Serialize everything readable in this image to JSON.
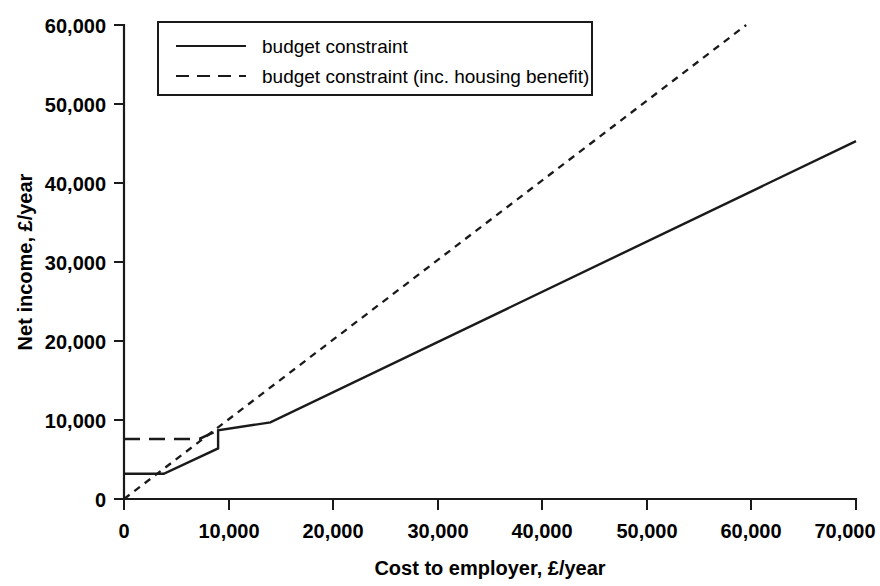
{
  "chart_data": {
    "type": "line",
    "title": "",
    "xlabel": "Cost to employer, £/year",
    "ylabel": "Net income, £/year",
    "xlim": [
      0,
      70000
    ],
    "ylim": [
      0,
      60000
    ],
    "xticks": [
      0,
      10000,
      20000,
      30000,
      40000,
      50000,
      60000,
      70000
    ],
    "yticks": [
      0,
      10000,
      20000,
      30000,
      40000,
      50000,
      60000
    ],
    "xticklabels": [
      "0",
      "10,000",
      "20,000",
      "30,000",
      "40,000",
      "50,000",
      "60,000",
      "70,000"
    ],
    "yticklabels": [
      "0",
      "10,000",
      "20,000",
      "30,000",
      "40,000",
      "50,000",
      "60,000"
    ],
    "grid": false,
    "legend_position": "upper-left-inside",
    "series": [
      {
        "name": "budget constraint",
        "style": "solid",
        "points": [
          [
            0,
            3200
          ],
          [
            3800,
            3200
          ],
          [
            9000,
            6400
          ],
          [
            9000,
            8700
          ],
          [
            14000,
            9700
          ],
          [
            70000,
            45300
          ]
        ]
      },
      {
        "name": "budget constraint (inc. housing benefit)",
        "style": "dashed",
        "segments": [
          {
            "comment": "housing-benefit plateau",
            "points": [
              [
                0,
                7600
              ],
              [
                7200,
                7600
              ],
              [
                9000,
                8700
              ]
            ]
          },
          {
            "comment": "gross ray from origin",
            "points": [
              [
                0,
                0
              ],
              [
                59500,
                60000
              ]
            ]
          }
        ]
      }
    ]
  },
  "legend": {
    "entries": [
      {
        "label": "budget constraint",
        "style": "solid"
      },
      {
        "label": "budget constraint (inc. housing benefit)",
        "style": "dashed"
      }
    ]
  },
  "axes": {
    "x_title": "Cost to employer, £/year",
    "y_title": "Net income, £/year",
    "x_tick_labels": [
      "0",
      "10,000",
      "20,000",
      "30,000",
      "40,000",
      "50,000",
      "60,000",
      "70,000"
    ],
    "y_tick_labels": [
      "60,000",
      "50,000",
      "40,000",
      "30,000",
      "20,000",
      "10,000",
      "0"
    ]
  },
  "colors": {
    "ink": "#1a1a1a",
    "background": "#ffffff"
  }
}
